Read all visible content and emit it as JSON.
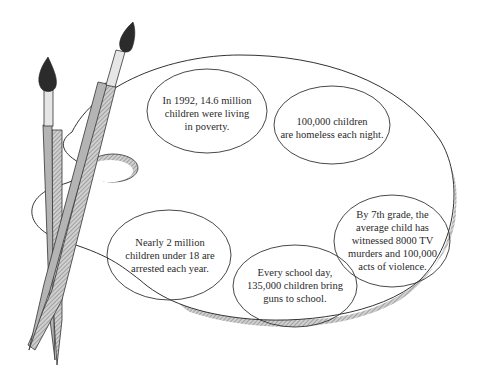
{
  "illustration": {
    "subject": "artist palette with two paint brushes",
    "colors": {
      "outline": "#333333",
      "shadow": "#9a9a9a",
      "brush_handle": "#b4b4b4",
      "brush_ferrule": "#e6e6e6",
      "brush_tip": "#2b2b2b",
      "background": "#ffffff"
    }
  },
  "facts": [
    {
      "id": "poverty",
      "text": "In 1992, 14.6 million\nchildren were living\nin poverty."
    },
    {
      "id": "homeless",
      "text": "100,000 children\nare homeless each night."
    },
    {
      "id": "tv-violence",
      "text": "By 7th grade, the\naverage child has\nwitnessed 8000 TV\nmurders and 100,000\nacts of violence."
    },
    {
      "id": "arrests",
      "text": "Nearly 2 million\nchildren under 18 are\narrested each year."
    },
    {
      "id": "guns",
      "text": "Every school day,\n135,000 children bring\nguns to school."
    }
  ]
}
